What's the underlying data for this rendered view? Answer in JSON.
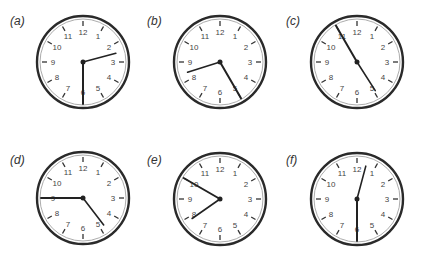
{
  "figure": {
    "panels": [
      {
        "id": "a",
        "label": "(a)",
        "time": "2:30",
        "hour": 2,
        "minute": 30,
        "cx": 83,
        "cy": 62,
        "label_x": 10,
        "label_y": 14
      },
      {
        "id": "b",
        "label": "(b)",
        "time": "8:25",
        "hour": 8,
        "minute": 25,
        "cx": 220,
        "cy": 62,
        "label_x": 147,
        "label_y": 14
      },
      {
        "id": "c",
        "label": "(c)",
        "time": "4:55",
        "hour": 4,
        "minute": 55,
        "cx": 357,
        "cy": 62,
        "label_x": 286,
        "label_y": 14
      },
      {
        "id": "d",
        "label": "(d)",
        "time": "4:45",
        "hour": 4,
        "minute": 45,
        "cx": 83,
        "cy": 198,
        "label_x": 10,
        "label_y": 153
      },
      {
        "id": "e",
        "label": "(e)",
        "time": "7:50",
        "hour": 7,
        "minute": 50,
        "cx": 220,
        "cy": 199,
        "label_x": 147,
        "label_y": 153
      },
      {
        "id": "f",
        "label": "(f)",
        "time": "12:30",
        "hour": 12,
        "minute": 30,
        "cx": 357,
        "cy": 199,
        "label_x": 286,
        "label_y": 153
      }
    ],
    "clock_numbers": [
      "12",
      "1",
      "2",
      "3",
      "4",
      "5",
      "6",
      "7",
      "8",
      "9",
      "10",
      "11"
    ],
    "colors": {
      "rim": "#2a2a2a",
      "face": "#ffffff",
      "hands": "#222222",
      "numbers": "#444444",
      "ticks": "#333333"
    }
  }
}
